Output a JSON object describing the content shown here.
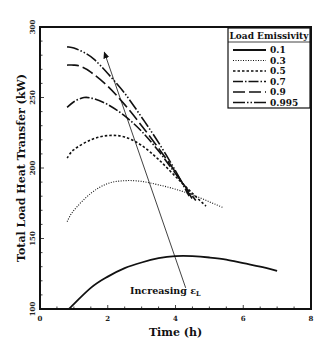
{
  "chart_data": {
    "type": "line",
    "title": "",
    "xlabel": "Time (h)",
    "ylabel": "Total Load Heat Transfer (kW)",
    "xlim": [
      0,
      8
    ],
    "ylim": [
      100,
      300
    ],
    "xticks": [
      0,
      2,
      4,
      6,
      8
    ],
    "yticks": [
      100,
      150,
      200,
      250,
      300
    ],
    "grid": false,
    "legend_position": "upper right",
    "legend_title": "Load Emissivity",
    "series": [
      {
        "name": "0.1",
        "style": "solid",
        "x": [
          0.85,
          1.5,
          2.0,
          2.5,
          3.0,
          3.5,
          4.0,
          4.5,
          5.0,
          5.5,
          6.0,
          6.5,
          7.0
        ],
        "y": [
          100,
          115,
          123,
          129,
          133,
          136,
          137.5,
          137.5,
          136.5,
          135,
          132.5,
          130,
          127
        ]
      },
      {
        "name": "0.3",
        "style": "dotted",
        "x": [
          0.8,
          1.0,
          1.5,
          2.0,
          2.5,
          3.0,
          3.5,
          4.0,
          4.5,
          5.0,
          5.4
        ],
        "y": [
          162,
          170,
          182,
          189,
          191,
          190.5,
          188,
          185,
          181,
          176,
          172
        ]
      },
      {
        "name": "0.5",
        "style": "dashed",
        "x": [
          0.8,
          1.0,
          1.5,
          2.0,
          2.5,
          3.0,
          3.5,
          4.0,
          4.5,
          4.9
        ],
        "y": [
          207,
          213,
          220,
          223,
          222,
          216,
          206,
          194,
          182,
          173
        ]
      },
      {
        "name": "0.7",
        "style": "dash-dot",
        "x": [
          0.8,
          1.0,
          1.3,
          1.6,
          2.0,
          2.5,
          3.0,
          3.5,
          4.0,
          4.6
        ],
        "y": [
          243,
          247,
          250,
          249,
          245,
          237,
          226,
          212,
          196,
          177
        ]
      },
      {
        "name": "0.9",
        "style": "long-dash",
        "x": [
          0.8,
          1.0,
          1.2,
          1.5,
          2.0,
          2.5,
          3.0,
          3.5,
          4.0,
          4.5
        ],
        "y": [
          273,
          273,
          272,
          268,
          258,
          245,
          230,
          214,
          197,
          178
        ]
      },
      {
        "name": "0.995",
        "style": "dash-dot-dot",
        "x": [
          0.8,
          1.0,
          1.3,
          1.6,
          2.0,
          2.5,
          3.0,
          3.5,
          4.0,
          4.4
        ],
        "y": [
          286,
          285,
          282,
          277,
          267,
          253,
          236,
          218,
          198,
          180
        ]
      }
    ],
    "annotations": [
      {
        "text": "Increasing ε_L",
        "x": 4.3,
        "y": 112,
        "arrow_from": [
          4.3,
          115
        ],
        "arrow_to": [
          1.9,
          282
        ]
      }
    ]
  },
  "labels": {
    "xlabel": "Time (h)",
    "ylabel": "Total Load Heat Transfer (kW)",
    "legend_title": "Load Emissivity",
    "annotation_main": "Increasing ε",
    "annotation_sub": "L",
    "xticks": [
      "0",
      "2",
      "4",
      "6",
      "8"
    ],
    "yticks": [
      "100",
      "150",
      "200",
      "250",
      "300"
    ],
    "legend": [
      "0.1",
      "0.3",
      "0.5",
      "0.7",
      "0.9",
      "0.995"
    ]
  }
}
